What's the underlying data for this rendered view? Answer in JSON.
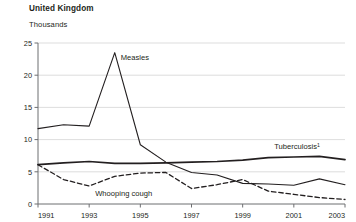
{
  "chart_data": {
    "type": "line",
    "title": "United Kingdom",
    "subtitle": "Thousands",
    "ylabel": "Thousands",
    "xlabel": "",
    "ylim": [
      0,
      25
    ],
    "xlim": [
      1991,
      2003
    ],
    "grid": true,
    "legend_position": "inline-annotations",
    "yticks": [
      "0",
      "5",
      "10",
      "15",
      "20",
      "25"
    ],
    "ytick_values": [
      0,
      5,
      10,
      15,
      20,
      25
    ],
    "xticks": [
      "1991",
      "1993",
      "1995",
      "1997",
      "1999",
      "2001",
      "2003"
    ],
    "xtick_values": [
      1991,
      1993,
      1995,
      1997,
      1999,
      2001,
      2003
    ],
    "x": [
      1991,
      1992,
      1993,
      1994,
      1995,
      1996,
      1997,
      1998,
      1999,
      2000,
      2001,
      2002,
      2003
    ],
    "series": [
      {
        "name": "Measles",
        "style": "solid",
        "color": "#231f20",
        "values": [
          11.7,
          12.3,
          12.1,
          23.5,
          9.2,
          6.5,
          4.9,
          4.5,
          3.2,
          3.1,
          2.9,
          3.9,
          3.0
        ]
      },
      {
        "name": "Tuberculosis",
        "footnote_marker": "1",
        "style": "solid-thick",
        "color": "#231f20",
        "values": [
          6.1,
          6.4,
          6.6,
          6.3,
          6.3,
          6.4,
          6.5,
          6.6,
          6.8,
          7.2,
          7.3,
          7.4,
          6.9
        ]
      },
      {
        "name": "Whooping cough",
        "style": "dashed",
        "color": "#231f20",
        "values": [
          6.1,
          3.8,
          2.8,
          4.3,
          4.8,
          4.9,
          2.4,
          3.0,
          3.8,
          2.0,
          1.5,
          1.0,
          0.7
        ]
      }
    ],
    "annotations": [
      {
        "text": "Measles",
        "x": 1994,
        "y": 22.3
      },
      {
        "text": "Tuberculosis",
        "superscript": "1",
        "x": 2000,
        "y": 8.5
      },
      {
        "text": "Whooping cough",
        "x": 1993,
        "y": 1.3
      }
    ]
  }
}
